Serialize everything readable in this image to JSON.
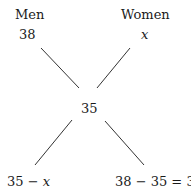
{
  "diagram": {
    "type": "alligation-cross",
    "top_left": {
      "heading": "Men",
      "value": "38"
    },
    "top_right": {
      "heading": "Women",
      "value": "x"
    },
    "center": {
      "value": "35"
    },
    "bottom_left": {
      "value_prefix": "35 − ",
      "value_var": "x"
    },
    "bottom_right": {
      "value": "38 − 35 = 3"
    },
    "line_color": "#333333",
    "text_color": "#1a1a1a"
  }
}
